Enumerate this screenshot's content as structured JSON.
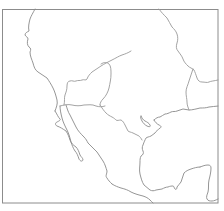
{
  "map": {
    "type": "outline-map",
    "region": "Mexico and southwestern North America",
    "labels": [],
    "colors": {
      "background": "#ffffff",
      "frame": "#8c8c8c",
      "coastline": "#8a8a8a",
      "border": "#9a9a9a"
    },
    "frame": {
      "x": 2,
      "y": 9,
      "width": 216,
      "height": 194
    },
    "features": [
      {
        "id": "pacific-coast-north",
        "kind": "coastline"
      },
      {
        "id": "baja-california-peninsula",
        "kind": "coastline"
      },
      {
        "id": "gulf-of-california-east-coast",
        "kind": "coastline"
      },
      {
        "id": "mexico-pacific-coast-south",
        "kind": "coastline"
      },
      {
        "id": "gulf-of-mexico-coast",
        "kind": "coastline"
      },
      {
        "id": "yucatan-peninsula",
        "kind": "coastline"
      },
      {
        "id": "florida-gulf-coast",
        "kind": "coastline"
      },
      {
        "id": "us-mexico-border",
        "kind": "border"
      },
      {
        "id": "rio-grande",
        "kind": "border"
      },
      {
        "id": "interior-region-boundary",
        "kind": "border"
      },
      {
        "id": "interior-region-boundary-east",
        "kind": "border"
      },
      {
        "id": "northeast-boundary",
        "kind": "border"
      }
    ]
  }
}
